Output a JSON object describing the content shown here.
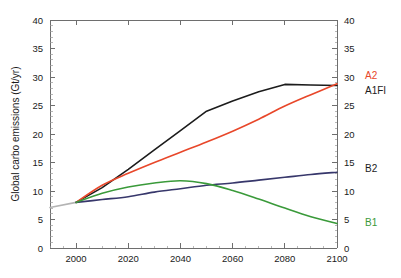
{
  "chart_data": {
    "type": "line",
    "title": "",
    "xlabel": "",
    "ylabel": "Global carbo emissions (Gt/yr)",
    "xlim": [
      1990,
      2100
    ],
    "ylim": [
      0,
      40
    ],
    "xticks": [
      2000,
      2020,
      2040,
      2060,
      2080,
      2100
    ],
    "yticks": [
      0,
      5,
      10,
      15,
      20,
      25,
      30,
      35,
      40
    ],
    "yticks_right": [
      0,
      5,
      10,
      15,
      20,
      25,
      30,
      35,
      40
    ],
    "grid": false,
    "legend_position": "right-inline-end-of-line",
    "x": [
      2000,
      2010,
      2020,
      2030,
      2040,
      2050,
      2060,
      2070,
      2080,
      2090,
      2100
    ],
    "series": [
      {
        "name": "A1FI",
        "label": "A1FI",
        "color": "#1c1c1c",
        "label_color": "#1c1c1c",
        "label_y_value": 27.6,
        "values": [
          8.0,
          10.6,
          13.8,
          17.2,
          20.6,
          24.0,
          25.8,
          27.4,
          28.7,
          28.6,
          28.5
        ]
      },
      {
        "name": "A2",
        "label": "A2",
        "color": "#e8472a",
        "label_color": "#e8472a",
        "label_y_value": 30.2,
        "values": [
          8.0,
          11.0,
          13.1,
          15.0,
          16.8,
          18.6,
          20.5,
          22.6,
          24.9,
          26.9,
          28.8
        ]
      },
      {
        "name": "B2",
        "label": "B2",
        "color": "#37376b",
        "label_color": "#1c1c1c",
        "label_y_value": 14.0,
        "values": [
          8.0,
          8.5,
          9.0,
          9.8,
          10.4,
          11.0,
          11.4,
          11.9,
          12.4,
          12.9,
          13.3
        ]
      },
      {
        "name": "B1",
        "label": "B1",
        "color": "#3a9a3a",
        "label_color": "#3a9a3a",
        "label_y_value": 4.4,
        "values": [
          8.0,
          9.6,
          10.7,
          11.4,
          11.8,
          11.3,
          10.1,
          8.6,
          7.0,
          5.5,
          4.3
        ]
      }
    ],
    "historical": {
      "name": "historical",
      "color": "#b4b4b4",
      "x": [
        1990,
        2000
      ],
      "values": [
        7.1,
        8.0
      ]
    }
  }
}
